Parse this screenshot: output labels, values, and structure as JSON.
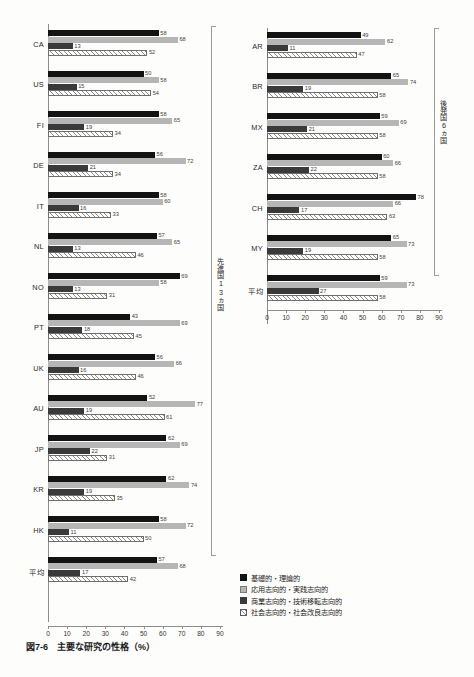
{
  "caption": {
    "number": "図7-6",
    "title": "主要な研究の性格（%）"
  },
  "legend": [
    {
      "key": "basic",
      "label": "基礎的・理論的",
      "color": "#131313"
    },
    {
      "key": "applied",
      "label": "応用志向的・実践志向的",
      "color": "#b6b6b6"
    },
    {
      "key": "commercial",
      "label": "商業志向的・技術移転志向的",
      "color": "#3a3a3a"
    },
    {
      "key": "social",
      "label": "社会志向的・社会改良志向的",
      "color": "#ffffff"
    }
  ],
  "annotations": {
    "left_group": "先進国13ヵ国",
    "right_group": "後発国6ヵ国"
  },
  "chart_data": {
    "type": "bar",
    "title": "主要な研究の性格（%）",
    "xlabel": "",
    "ylabel": "",
    "xlim": [
      0,
      90
    ],
    "xticks": [
      0,
      10,
      20,
      30,
      40,
      50,
      60,
      70,
      80,
      90
    ],
    "grid": false,
    "orientation": "horizontal",
    "legend_position": "bottom-right",
    "series": [
      {
        "name": "基礎的・理論的",
        "color": "#131313"
      },
      {
        "name": "応用志向的・実践志向的",
        "color": "#b6b6b6"
      },
      {
        "name": "商業志向的・技術移転志向的",
        "color": "#3a3a3a"
      },
      {
        "name": "社会志向的・社会改良志向的",
        "color": "#ffffff"
      }
    ],
    "panels": [
      {
        "name": "先進国13ヵ国",
        "categories": [
          "CA",
          "US",
          "FI",
          "DE",
          "IT",
          "NL",
          "NO",
          "PT",
          "UK",
          "AU",
          "JP",
          "KR",
          "HK",
          "平均"
        ],
        "values": [
          [
            58,
            68,
            13,
            52
          ],
          [
            50,
            58,
            15,
            54
          ],
          [
            58,
            65,
            19,
            34
          ],
          [
            56,
            72,
            21,
            34
          ],
          [
            58,
            60,
            16,
            33
          ],
          [
            57,
            65,
            13,
            46
          ],
          [
            69,
            58,
            13,
            31
          ],
          [
            43,
            69,
            18,
            45
          ],
          [
            56,
            66,
            16,
            46
          ],
          [
            52,
            77,
            19,
            61
          ],
          [
            62,
            69,
            22,
            31
          ],
          [
            62,
            74,
            19,
            35
          ],
          [
            58,
            72,
            11,
            50
          ],
          [
            57,
            68,
            17,
            42
          ]
        ]
      },
      {
        "name": "後発国6ヵ国",
        "categories": [
          "AR",
          "BR",
          "MX",
          "ZA",
          "CH",
          "MY",
          "平均"
        ],
        "values": [
          [
            49,
            62,
            11,
            47
          ],
          [
            65,
            74,
            19,
            58
          ],
          [
            59,
            69,
            21,
            58
          ],
          [
            60,
            66,
            22,
            58
          ],
          [
            78,
            66,
            17,
            63
          ],
          [
            65,
            73,
            19,
            58
          ],
          [
            59,
            73,
            27,
            58
          ]
        ]
      }
    ]
  }
}
